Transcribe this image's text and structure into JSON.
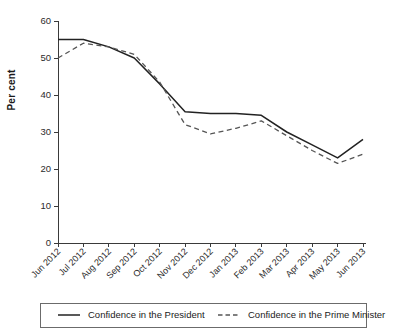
{
  "chart_data": {
    "type": "line",
    "title": "",
    "xlabel": "",
    "ylabel": "Per cent",
    "ylim": [
      0,
      60
    ],
    "ytick_values": [
      0,
      10,
      20,
      30,
      40,
      50,
      60
    ],
    "ytick_labels": [
      "0",
      "10",
      "20",
      "30",
      "40",
      "50",
      "60"
    ],
    "grid": false,
    "legend_position": "bottom",
    "categories": [
      "Jun 2012",
      "Jul 2012",
      "Aug 2012",
      "Sep 2012",
      "Oct 2012",
      "Nov 2012",
      "Dec 2012",
      "Jan 2013",
      "Feb 2013",
      "Mar 2013",
      "Apr 2013",
      "May 2013",
      "Jun 2013"
    ],
    "series": [
      {
        "name": "Confidence in the President",
        "style": "solid",
        "color": "#222222",
        "values": [
          55,
          55,
          53,
          50,
          43,
          35.5,
          35,
          35,
          34.5,
          30,
          26.5,
          23,
          28
        ]
      },
      {
        "name": "Confidence in the Prime Minister",
        "style": "dashed",
        "color": "#555555",
        "values": [
          50,
          54,
          53,
          51,
          43.5,
          32,
          29.5,
          31,
          33,
          29,
          25,
          21.5,
          24
        ]
      }
    ]
  },
  "axis": {
    "y_title": "Per cent"
  },
  "legend": {
    "items": [
      {
        "label": "Confidence in the President",
        "style": "solid"
      },
      {
        "label": "Confidence in the Prime Minister",
        "style": "dashed"
      }
    ]
  }
}
